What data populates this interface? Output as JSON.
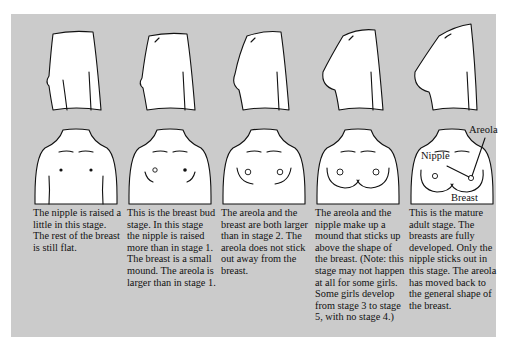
{
  "figure": {
    "background_color": "#cbcbcb",
    "stages": [
      {
        "stage": 1,
        "caption": "The nipple is raised a little in this stage. The rest of the breast is still flat."
      },
      {
        "stage": 2,
        "caption": "This is the breast bud stage. In this stage the nipple is raised more than in stage 1. The breast is a small mound. The areola is larger than in stage 1."
      },
      {
        "stage": 3,
        "caption": "The areola and the breast are both larger than in stage 2. The areola does not stick out away from the breast."
      },
      {
        "stage": 4,
        "caption": "The areola and the nipple make up a mound that sticks up above the shape of the breast. (Note: this stage may not happen at all for some girls. Some girls develop from stage 3 to stage 5, with no stage 4.)"
      },
      {
        "stage": 5,
        "caption": "This is the mature adult stage. The breasts are fully developed. Only the nipple sticks out in this stage. The areola has moved back to the general shape of the breast."
      }
    ],
    "labels": {
      "areola": "Areola",
      "nipple": "Nipple",
      "breast": "Breast"
    }
  }
}
